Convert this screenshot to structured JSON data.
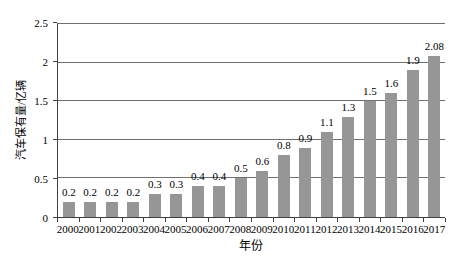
{
  "figure": {
    "background": "#ffffff"
  },
  "chart_data": {
    "type": "bar",
    "title": "",
    "xlabel": "年份",
    "ylabel": "汽车保有量/亿辆",
    "categories": [
      "2000",
      "2001",
      "2002",
      "2003",
      "2004",
      "2005",
      "2006",
      "2007",
      "2008",
      "2009",
      "2010",
      "2011",
      "2012",
      "2013",
      "2014",
      "2015",
      "2016",
      "2017"
    ],
    "values": [
      0.2,
      0.2,
      0.2,
      0.2,
      0.3,
      0.3,
      0.4,
      0.4,
      0.5,
      0.6,
      0.8,
      0.9,
      1.1,
      1.3,
      1.5,
      1.6,
      1.9,
      2.08
    ],
    "value_labels": [
      "0.2",
      "0.2",
      "0.2",
      "0.2",
      "0.3",
      "0.3",
      "0.4",
      "0.4",
      "0.5",
      "0.6",
      "0.8",
      "0.9",
      "1.1",
      "1.3",
      "1.5",
      "1.6",
      "1.9",
      "2.08"
    ],
    "ylim": [
      0,
      2.5
    ],
    "yticks": [
      {
        "value": 0,
        "label": "0"
      },
      {
        "value": 0.5,
        "label": "0.5"
      },
      {
        "value": 1,
        "label": "1"
      },
      {
        "value": 1.5,
        "label": "1.5"
      },
      {
        "value": 2,
        "label": "2"
      },
      {
        "value": 2.5,
        "label": "2.5"
      }
    ],
    "grid": "horizontal",
    "legend": "none",
    "bar_color": "#969696",
    "gridline_color": "#707070",
    "axis_color": "#404040"
  }
}
